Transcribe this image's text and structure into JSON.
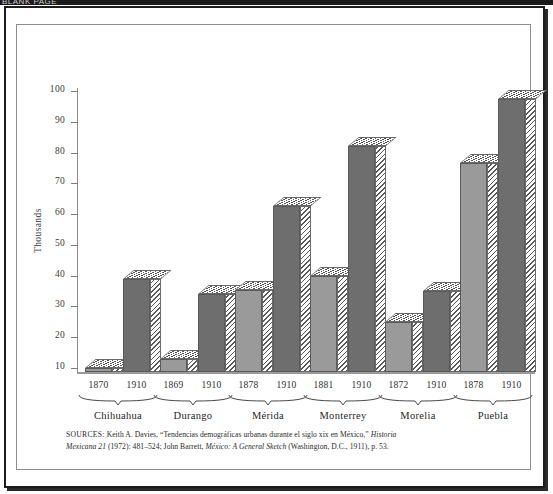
{
  "page": {
    "top_artifact_text": "BLANK PAGE"
  },
  "chart_data": {
    "type": "bar",
    "title": "",
    "subtitle": "",
    "xlabel": "",
    "ylabel": "Thousands",
    "ylim": [
      0,
      100
    ],
    "yticks": [
      10,
      20,
      30,
      40,
      50,
      60,
      70,
      80,
      90,
      100
    ],
    "ytick_labels": [
      "10",
      "20",
      "30",
      "40",
      "50",
      "60",
      "70",
      "80",
      "90",
      "100"
    ],
    "grid": false,
    "legend": "none",
    "categories": [
      "Chihuahua",
      "Durango",
      "Mérida",
      "Monterrey",
      "Morelia",
      "Puebla"
    ],
    "groups": [
      {
        "city": "Chihuahua",
        "bars": [
          {
            "year": "1870",
            "value": 10.0,
            "shade": "light"
          },
          {
            "year": "1910",
            "value": 39.0,
            "shade": "dark"
          }
        ]
      },
      {
        "city": "Durango",
        "bars": [
          {
            "year": "1869",
            "value": 13.0,
            "shade": "light"
          },
          {
            "year": "1910",
            "value": 34.0,
            "shade": "dark"
          }
        ]
      },
      {
        "city": "Mérida",
        "bars": [
          {
            "year": "1878",
            "value": 35.5,
            "shade": "light"
          },
          {
            "year": "1910",
            "value": 62.5,
            "shade": "dark"
          }
        ]
      },
      {
        "city": "Monterrey",
        "bars": [
          {
            "year": "1881",
            "value": 40.0,
            "shade": "light"
          },
          {
            "year": "1910",
            "value": 82.0,
            "shade": "dark"
          }
        ]
      },
      {
        "city": "Morelia",
        "bars": [
          {
            "year": "1872",
            "value": 25.0,
            "shade": "light"
          },
          {
            "year": "1910",
            "value": 35.0,
            "shade": "dark"
          }
        ]
      },
      {
        "city": "Puebla",
        "bars": [
          {
            "year": "1878",
            "value": 76.5,
            "shade": "light"
          },
          {
            "year": "1910",
            "value": 97.5,
            "shade": "dark"
          }
        ]
      }
    ],
    "colors": {
      "light_bar": "#9a9a9a",
      "dark_bar": "#6e6e6e",
      "hatch_line": "#585858",
      "axis": "#8b8b8b",
      "text": "#2b2b2b",
      "frame": "#1c1c1c"
    }
  },
  "sources": {
    "label": "SOURCES:",
    "line1_a": " Keith A. Davies, “Tendencias demográficas urbanas durante el siglo xix en México,” ",
    "line1_italic": "Historia",
    "line2_a": "Mexicana 21",
    "line2_b": " (1972): 481–524; John Barrett, ",
    "line2_italic": "México: A General Sketch",
    "line2_c": " (Washington, D.C., 1911), p. 53."
  }
}
